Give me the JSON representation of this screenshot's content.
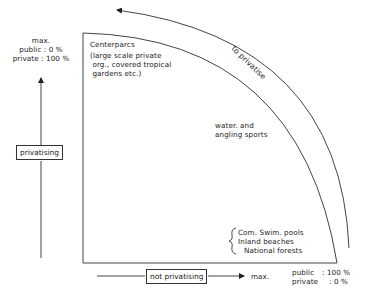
{
  "y_axis": {
    "label": "privatising",
    "max_label": {
      "title": "max.",
      "public": "public : 0 %",
      "private": "private : 100 %"
    }
  },
  "x_axis": {
    "label": "not privatising",
    "max_text": "max.",
    "max_label": {
      "public_key": "public",
      "public_val": ": 100 %",
      "private_key": "private",
      "private_val": ": 0 %"
    }
  },
  "arc_label": "to privatise",
  "regions": [
    {
      "id": "centerparcs",
      "lines": [
        "Centerparcs",
        "(large scale private",
        " org., covered tropical",
        " gardens etc.)"
      ]
    },
    {
      "id": "water",
      "lines": [
        "water. and",
        "angling sports"
      ]
    },
    {
      "id": "public-facilities",
      "lines": [
        "Com. Swim. pools",
        "Inland beaches",
        "National forests"
      ]
    }
  ],
  "colors": {
    "line": "#333333",
    "text": "#1a1a1a",
    "background": "#ffffff"
  }
}
